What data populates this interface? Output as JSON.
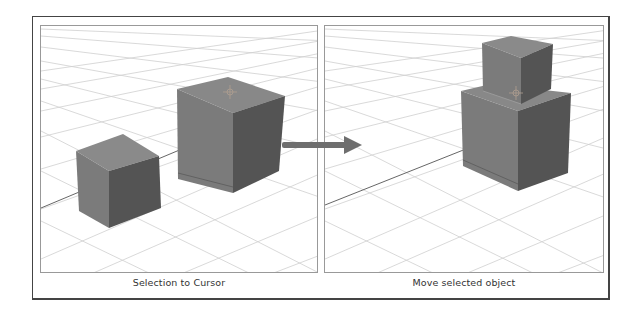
{
  "figure": {
    "left_panel": {
      "caption": "Selection to Cursor",
      "objects": [
        "small-cube",
        "large-cube",
        "3d-cursor"
      ]
    },
    "right_panel": {
      "caption": "Move selected object",
      "objects": [
        "small-cube-stacked",
        "large-cube",
        "3d-cursor"
      ]
    },
    "arrow": {
      "direction": "right",
      "color": "#6e6e6e"
    }
  },
  "colors": {
    "frame_border": "#444444",
    "panel_border": "#999999",
    "grid_line": "#c8c8c8",
    "cube_front": "#7a7a7a",
    "cube_side": "#555555",
    "cube_top": "#858585",
    "background": "#ffffff"
  }
}
